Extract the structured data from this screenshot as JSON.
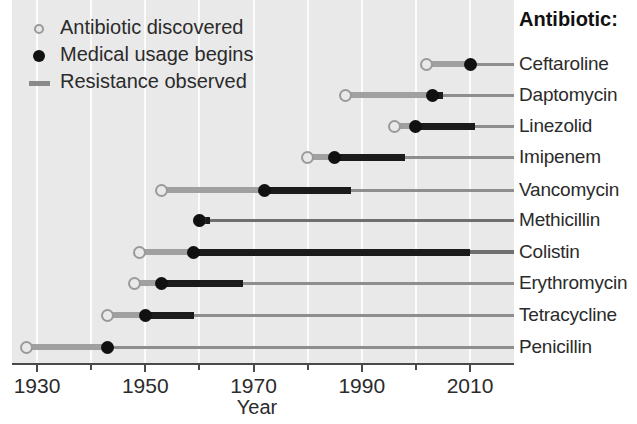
{
  "chart_data": {
    "type": "timeline",
    "title": "",
    "xlabel": "Year",
    "ylabel": "Antibiotic:",
    "xlim": [
      1925,
      2016
    ],
    "xticks_major": [
      1930,
      1950,
      1970,
      1990,
      2010
    ],
    "xticks_major_labels": [
      "1930",
      "1950",
      "1970",
      "1990",
      "2010"
    ],
    "xticks_minor": [
      1940,
      1960,
      1980,
      2000
    ],
    "grid": "vertical-white-decade",
    "legend_position": "top-left",
    "legend": [
      {
        "key": "discovered",
        "marker": "open-circle",
        "label": "Antibiotic discovered"
      },
      {
        "key": "usage",
        "marker": "filled-circle",
        "label": "Medical usage begins"
      },
      {
        "key": "resistance",
        "marker": "line",
        "label": "Resistance observed"
      }
    ],
    "colors": {
      "plot_background": "#e9e9e9",
      "gridline": "#fbfbfb",
      "pre_usage_line": "#a0a0a0",
      "resistance_line": "#1b1b1b",
      "open_marker_edge": "#9a9a9a",
      "filled_marker": "#111111",
      "axis": "#4a4a4a",
      "text": "#2b2b2b"
    },
    "series": [
      {
        "name": "Ceftaroline",
        "discovered": 2002,
        "usage": 2010,
        "resistance_start": 2010,
        "resistance_end": 2011,
        "line_end": 2016
      },
      {
        "name": "Daptomycin",
        "discovered": 1987,
        "usage": 2003,
        "resistance_start": 2003,
        "resistance_end": 2005,
        "line_end": 2016
      },
      {
        "name": "Linezolid",
        "discovered": 1996,
        "usage": 2000,
        "resistance_start": 2000,
        "resistance_end": 2011,
        "line_end": 2016
      },
      {
        "name": "Imipenem",
        "discovered": 1980,
        "usage": 1985,
        "resistance_start": 1985,
        "resistance_end": 1998,
        "line_end": 2016
      },
      {
        "name": "Vancomycin",
        "discovered": 1953,
        "usage": 1972,
        "resistance_start": 1972,
        "resistance_end": 1988,
        "line_end": 2016
      },
      {
        "name": "Methicillin",
        "discovered": 1960,
        "usage": 1960,
        "resistance_start": 1960,
        "resistance_end": 1962,
        "line_end": 2016
      },
      {
        "name": "Colistin",
        "discovered": 1949,
        "usage": 1959,
        "resistance_start": 1959,
        "resistance_end": 2010,
        "line_end": 2016
      },
      {
        "name": "Erythromycin",
        "discovered": 1948,
        "usage": 1953,
        "resistance_start": 1953,
        "resistance_end": 1968,
        "line_end": 2016
      },
      {
        "name": "Tetracycline",
        "discovered": 1943,
        "usage": 1950,
        "resistance_start": 1950,
        "resistance_end": 1959,
        "line_end": 2016
      },
      {
        "name": "Penicillin",
        "discovered": 1928,
        "usage": 1943,
        "resistance_start": 1943,
        "resistance_end": 1943,
        "line_end": 2016
      }
    ]
  },
  "axis": {
    "x_title": "Year",
    "tick_labels": [
      "1930",
      "1950",
      "1970",
      "1990",
      "2010"
    ]
  },
  "legend": {
    "discovered": "Antibiotic discovered",
    "usage": "Medical usage begins",
    "resistance": "Resistance observed"
  },
  "right_panel": {
    "caption": "Antibiotic:",
    "labels": [
      "Ceftaroline",
      "Daptomycin",
      "Linezolid",
      "Imipenem",
      "Vancomycin",
      "Methicillin",
      "Colistin",
      "Erythromycin",
      "Tetracycline",
      "Penicillin"
    ]
  }
}
